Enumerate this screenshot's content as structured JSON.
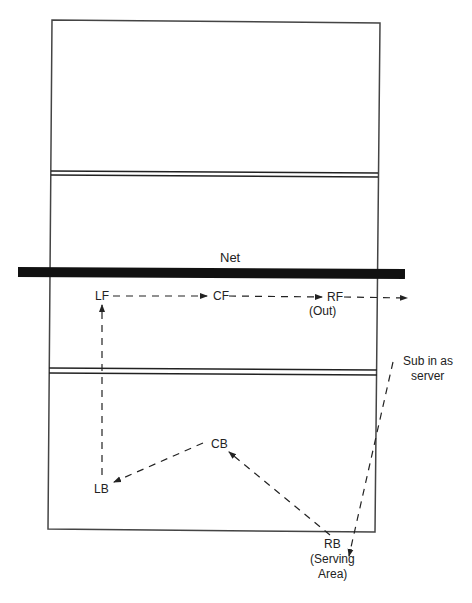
{
  "diagram": {
    "net_label": "Net",
    "colors": {
      "line": "#333333",
      "net": "#111111",
      "background": "#ffffff"
    },
    "positions": {
      "lf": "LF",
      "cf": "CF",
      "rf": "RF",
      "rf_note": "(Out)",
      "lb": "LB",
      "cb": "CB",
      "rb": "RB",
      "rb_note_1": "(Serving",
      "rb_note_2": "Area)"
    },
    "sub_note_1": "Sub in as",
    "sub_note_2": "server",
    "arrows": [
      {
        "from": "LF",
        "to": "CF"
      },
      {
        "from": "CF",
        "to": "RF"
      },
      {
        "from": "RF",
        "to": "off-court (Out)"
      },
      {
        "from": "LB",
        "to": "LF"
      },
      {
        "from": "CB",
        "to": "LB"
      },
      {
        "from": "RB",
        "to": "CB"
      },
      {
        "from": "Sub (off-court)",
        "to": "RB serving area"
      }
    ]
  }
}
